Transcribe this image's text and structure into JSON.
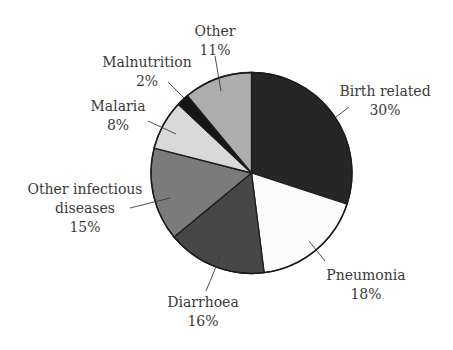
{
  "chart_data": {
    "type": "pie",
    "title": "",
    "start_angle_deg": 0,
    "direction": "clockwise",
    "center": [
      251.5,
      173
    ],
    "radius": 100.5,
    "slices": [
      {
        "label": "Birth related",
        "value": 30,
        "value_label": "30%",
        "color": "#262626",
        "label_lines": [
          "Birth related",
          "30%"
        ],
        "label_pos": [
          385,
          96
        ],
        "leader": [
          [
            336,
            117
          ],
          [
            349,
            107
          ]
        ]
      },
      {
        "label": "Pneumonia",
        "value": 18,
        "value_label": "18%",
        "color": "#fbfbfb",
        "label_lines": [
          "Pneumonia",
          "18%"
        ],
        "label_pos": [
          366,
          280
        ],
        "leader": [
          [
            309,
            241
          ],
          [
            325,
            261
          ]
        ]
      },
      {
        "label": "Diarrhoea",
        "value": 16,
        "value_label": "16%",
        "color": "#474747",
        "label_lines": [
          "Diarrhoea",
          "16%"
        ],
        "label_pos": [
          203,
          307
        ],
        "leader": [
          [
            220,
            257
          ],
          [
            206,
            291
          ]
        ]
      },
      {
        "label": "Other infectious diseases",
        "value": 15,
        "value_label": "15%",
        "color": "#7b7b7b",
        "label_lines": [
          "Other infectious",
          "diseases",
          "15%"
        ],
        "label_pos": [
          85,
          194
        ],
        "leader": [
          [
            170,
            198
          ],
          [
            130,
            208
          ]
        ]
      },
      {
        "label": "Malaria",
        "value": 8,
        "value_label": "8%",
        "color": "#d9d9d9",
        "label_lines": [
          "Malaria",
          "8%"
        ],
        "label_pos": [
          118,
          111
        ],
        "leader": [
          [
            176,
            134
          ],
          [
            148,
            121
          ]
        ]
      },
      {
        "label": "Malnutrition",
        "value": 2,
        "value_label": "2%",
        "color": "#161616",
        "label_lines": [
          "Malnutrition",
          "2%"
        ],
        "label_pos": [
          147,
          67
        ],
        "leader": [
          [
            184,
            98
          ],
          [
            168,
            82
          ]
        ]
      },
      {
        "label": "Other",
        "value": 11,
        "value_label": "11%",
        "color": "#adadad",
        "label_lines": [
          "Other",
          "11%"
        ],
        "label_pos": [
          215,
          36
        ],
        "leader": [
          [
            221,
            91
          ],
          [
            215,
            56
          ]
        ]
      }
    ],
    "legend": "none (direct labels with leader lines)"
  }
}
